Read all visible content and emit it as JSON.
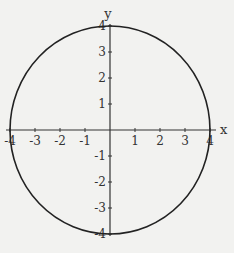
{
  "chart_data": {
    "type": "line",
    "title": "",
    "xlabel": "x",
    "ylabel": "y",
    "xlim": [
      -4,
      4
    ],
    "ylim": [
      -4,
      4
    ],
    "grid": false,
    "legend": null,
    "x_ticks": [
      -4,
      -3,
      -2,
      -1,
      1,
      2,
      3,
      4
    ],
    "y_ticks": [
      -4,
      -3,
      -2,
      -1,
      1,
      2,
      3,
      4
    ],
    "x_tick_labels": [
      "-4",
      "-3",
      "-2",
      "-1",
      "1",
      "2",
      "3",
      "4"
    ],
    "y_tick_labels": [
      "-4",
      "-3",
      "-2",
      "-1",
      "1",
      "2",
      "3",
      "4"
    ],
    "series": [
      {
        "name": "circle x^2 + y^2 = 16",
        "shape": "circle",
        "center": [
          0,
          0
        ],
        "radius": 4
      }
    ]
  },
  "colors": {
    "background": "#f2f2f0",
    "axis": "#333333",
    "curve": "#222222"
  },
  "layout": {
    "origin_px": [
      110,
      130
    ],
    "x_scale_px": 25,
    "y_scale_px": 26
  }
}
